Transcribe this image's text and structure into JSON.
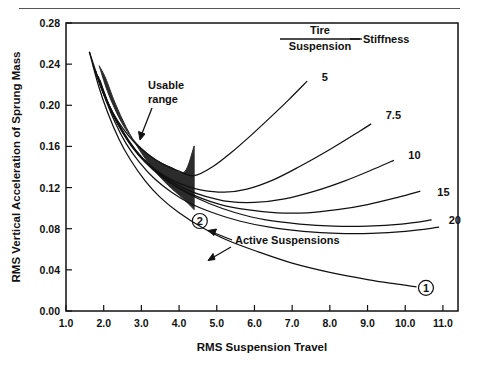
{
  "chart_data": {
    "type": "line",
    "title": "",
    "xlabel": "RMS Suspension Travel",
    "ylabel": "RMS Vertical Acceleration of Sprung Mass",
    "xlim": [
      1.0,
      11.4
    ],
    "ylim": [
      0.0,
      0.28
    ],
    "xticks": [
      "1.0",
      "2.0",
      "3.0",
      "4.0",
      "5.0",
      "6.0",
      "7.0",
      "8.0",
      "9.0",
      "10.0",
      "11.0"
    ],
    "xtick_values": [
      1.0,
      2.0,
      3.0,
      4.0,
      5.0,
      6.0,
      7.0,
      8.0,
      9.0,
      10.0,
      11.0
    ],
    "yticks": [
      "0.00",
      "0.04",
      "0.08",
      "0.12",
      "0.16",
      "0.20",
      "0.24",
      "0.28"
    ],
    "ytick_values": [
      0.0,
      0.04,
      0.08,
      0.12,
      0.16,
      0.2,
      0.24,
      0.28
    ],
    "grid": false,
    "legend_position": "on-curve-right-labels",
    "legend_title_numerator": "Tire",
    "legend_title_denominator": "Suspension",
    "legend_title_suffix": "Stiffness",
    "series": [
      {
        "name": "5",
        "label": "5",
        "label_x": 7.65,
        "label_y": 0.2275,
        "points": [
          [
            1.62,
            0.252
          ],
          [
            1.8,
            0.232
          ],
          [
            2.0,
            0.212
          ],
          [
            2.25,
            0.1925
          ],
          [
            2.5,
            0.178
          ],
          [
            2.8,
            0.1645
          ],
          [
            3.1,
            0.1545
          ],
          [
            3.4,
            0.1465
          ],
          [
            3.7,
            0.1405
          ],
          [
            4.0,
            0.136
          ],
          [
            4.4,
            0.1315
          ],
          [
            4.9,
            0.1405
          ],
          [
            5.4,
            0.1545
          ],
          [
            5.9,
            0.1705
          ],
          [
            6.4,
            0.1875
          ],
          [
            6.9,
            0.205
          ],
          [
            7.4,
            0.2235
          ]
        ]
      },
      {
        "name": "7.5",
        "label": "7.5",
        "label_x": 9.35,
        "label_y": 0.1905,
        "points": [
          [
            1.72,
            0.2385
          ],
          [
            1.95,
            0.2155
          ],
          [
            2.2,
            0.194
          ],
          [
            2.5,
            0.1735
          ],
          [
            2.8,
            0.158
          ],
          [
            3.1,
            0.146
          ],
          [
            3.4,
            0.1365
          ],
          [
            3.8,
            0.1275
          ],
          [
            4.2,
            0.1215
          ],
          [
            4.6,
            0.1175
          ],
          [
            5.2,
            0.1155
          ],
          [
            5.8,
            0.1185
          ],
          [
            6.5,
            0.1275
          ],
          [
            7.2,
            0.1405
          ],
          [
            8.0,
            0.157
          ],
          [
            8.8,
            0.175
          ],
          [
            9.1,
            0.182
          ]
        ]
      },
      {
        "name": "10",
        "label": "10",
        "label_x": 9.95,
        "label_y": 0.1515,
        "points": [
          [
            1.78,
            0.2335
          ],
          [
            2.0,
            0.211
          ],
          [
            2.3,
            0.1875
          ],
          [
            2.6,
            0.1685
          ],
          [
            2.9,
            0.1535
          ],
          [
            3.3,
            0.139
          ],
          [
            3.7,
            0.128
          ],
          [
            4.2,
            0.118
          ],
          [
            4.7,
            0.1115
          ],
          [
            5.3,
            0.1065
          ],
          [
            6.0,
            0.1055
          ],
          [
            6.8,
            0.109
          ],
          [
            7.6,
            0.1165
          ],
          [
            8.4,
            0.1265
          ],
          [
            9.2,
            0.1385
          ],
          [
            9.7,
            0.1465
          ]
        ]
      },
      {
        "name": "15",
        "label": "15",
        "label_x": 10.72,
        "label_y": 0.1155,
        "points": [
          [
            1.85,
            0.2285
          ],
          [
            2.1,
            0.2035
          ],
          [
            2.4,
            0.1805
          ],
          [
            2.75,
            0.1595
          ],
          [
            3.1,
            0.1445
          ],
          [
            3.5,
            0.1315
          ],
          [
            4.0,
            0.1195
          ],
          [
            4.5,
            0.111
          ],
          [
            5.1,
            0.1035
          ],
          [
            5.8,
            0.0985
          ],
          [
            6.6,
            0.0955
          ],
          [
            7.4,
            0.0955
          ],
          [
            8.2,
            0.0985
          ],
          [
            9.0,
            0.1035
          ],
          [
            9.8,
            0.1105
          ],
          [
            10.4,
            0.1165
          ]
        ]
      },
      {
        "name": "20",
        "label": "20",
        "label_x": 11.02,
        "label_y": 0.0885,
        "points": [
          [
            1.9,
            0.2245
          ],
          [
            2.15,
            0.1995
          ],
          [
            2.5,
            0.1755
          ],
          [
            2.85,
            0.1565
          ],
          [
            3.25,
            0.1405
          ],
          [
            3.7,
            0.1265
          ],
          [
            4.2,
            0.115
          ],
          [
            4.8,
            0.1045
          ],
          [
            5.5,
            0.0955
          ],
          [
            6.3,
            0.0885
          ],
          [
            7.2,
            0.0845
          ],
          [
            8.1,
            0.0825
          ],
          [
            9.0,
            0.0825
          ],
          [
            9.9,
            0.0845
          ],
          [
            10.7,
            0.0885
          ]
        ]
      },
      {
        "name": "active-suspension-1",
        "label": "1",
        "label_x": 10.55,
        "label_y": 0.0225,
        "circled": true,
        "points": [
          [
            1.62,
            0.252
          ],
          [
            1.85,
            0.2205
          ],
          [
            2.1,
            0.1935
          ],
          [
            2.4,
            0.1675
          ],
          [
            2.7,
            0.1475
          ],
          [
            3.1,
            0.1265
          ],
          [
            3.5,
            0.1105
          ],
          [
            4.0,
            0.0955
          ],
          [
            4.6,
            0.0815
          ],
          [
            5.3,
            0.0685
          ],
          [
            6.1,
            0.0575
          ],
          [
            7.0,
            0.0465
          ],
          [
            8.0,
            0.0375
          ],
          [
            9.0,
            0.0305
          ],
          [
            9.7,
            0.0265
          ],
          [
            10.3,
            0.0235
          ]
        ]
      },
      {
        "name": "active-suspension-2",
        "label": "2",
        "label_x": 4.55,
        "label_y": 0.0875,
        "circled": true,
        "points": [
          [
            1.78,
            0.2335
          ],
          [
            2.0,
            0.2105
          ],
          [
            2.3,
            0.1835
          ],
          [
            2.6,
            0.1625
          ],
          [
            2.95,
            0.1445
          ],
          [
            3.35,
            0.1285
          ],
          [
            3.8,
            0.1155
          ],
          [
            4.3,
            0.1045
          ],
          [
            4.9,
            0.0955
          ],
          [
            5.6,
            0.0875
          ],
          [
            6.4,
            0.0815
          ],
          [
            7.3,
            0.0775
          ],
          [
            8.2,
            0.0755
          ],
          [
            9.1,
            0.0755
          ],
          [
            10.0,
            0.0775
          ],
          [
            10.9,
            0.0815
          ]
        ]
      }
    ],
    "shaded_region": {
      "label": "Usable range",
      "upper_boundary": [
        [
          1.88,
          0.2385
        ],
        [
          2.1,
          0.2135
        ],
        [
          2.4,
          0.1885
        ],
        [
          2.7,
          0.1705
        ],
        [
          3.05,
          0.1565
        ],
        [
          3.4,
          0.1465
        ],
        [
          3.8,
          0.1395
        ],
        [
          4.15,
          0.1355
        ],
        [
          4.4,
          0.1605
        ]
      ],
      "lower_boundary": [
        [
          4.4,
          0.0985
        ],
        [
          4.1,
          0.1095
        ],
        [
          3.7,
          0.1225
        ],
        [
          3.3,
          0.1385
        ],
        [
          2.95,
          0.1565
        ],
        [
          2.6,
          0.1785
        ],
        [
          2.3,
          0.2025
        ],
        [
          2.05,
          0.2265
        ],
        [
          1.88,
          0.2385
        ]
      ],
      "right_edge_x": 4.4
    },
    "annotations": [
      {
        "name": "usable-range",
        "text_line1": "Usable",
        "text_line2": "range",
        "x": 3.05,
        "y": 0.2335
      },
      {
        "name": "active-suspensions",
        "text": "Active Suspensions",
        "x": 5.3,
        "y": 0.0725
      }
    ]
  },
  "figure": {
    "top_rule": true
  }
}
